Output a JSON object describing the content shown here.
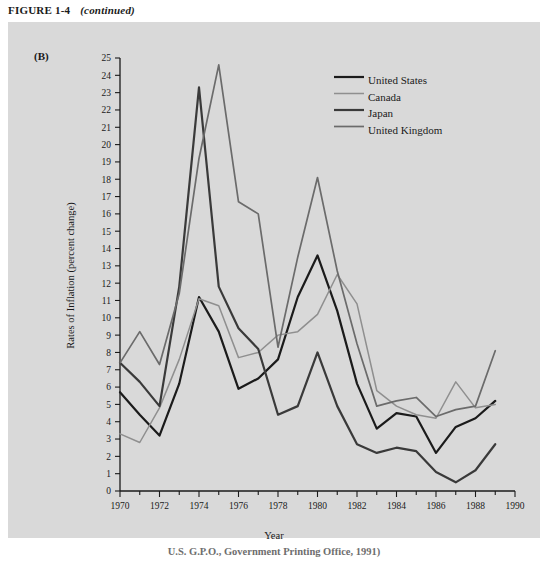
{
  "header": {
    "figure_number": "FIGURE 1-4",
    "continued": "(continued)"
  },
  "panel": {
    "label": "(B)"
  },
  "caption": {
    "text": "U.S. G.P.O., Government Printing Office, 1991)"
  },
  "axes": {
    "y_title": "Rates of Inflation (percent change)",
    "x_title": "Year",
    "y_ticks": [
      "0",
      "1",
      "2",
      "3",
      "4",
      "5",
      "6",
      "7",
      "8",
      "9",
      "10",
      "11",
      "12",
      "13",
      "14",
      "15",
      "16",
      "17",
      "18",
      "19",
      "20",
      "21",
      "22",
      "23",
      "24",
      "25"
    ],
    "x_ticks": [
      "1970",
      "1972",
      "1974",
      "1976",
      "1978",
      "1980",
      "1982",
      "1984",
      "1986",
      "1988",
      "1990"
    ]
  },
  "legend": {
    "position": "top-right",
    "entries": [
      {
        "label": "United States",
        "color": "#1b1b1b",
        "width": 2.2
      },
      {
        "label": "Canada",
        "color": "#8f8f8f",
        "width": 1.5
      },
      {
        "label": "Japan",
        "color": "#3a3a3a",
        "width": 2.2
      },
      {
        "label": "United Kingdom",
        "color": "#6b6b6b",
        "width": 1.7
      }
    ]
  },
  "chart_data": {
    "type": "line",
    "title": "Rates of Inflation (percent change)",
    "xlabel": "Year",
    "ylabel": "Rates of Inflation (percent change)",
    "xlim": [
      1970,
      1990
    ],
    "ylim": [
      0,
      25
    ],
    "grid": false,
    "legend_position": "top-right",
    "x": [
      1970,
      1971,
      1972,
      1973,
      1974,
      1975,
      1976,
      1977,
      1978,
      1979,
      1980,
      1981,
      1982,
      1983,
      1984,
      1985,
      1986,
      1987,
      1988,
      1989
    ],
    "series": [
      {
        "name": "United States",
        "color": "#1b1b1b",
        "values": [
          5.7,
          4.4,
          3.2,
          6.2,
          11.2,
          9.2,
          5.9,
          6.5,
          7.6,
          11.2,
          13.6,
          10.4,
          6.2,
          3.6,
          4.5,
          4.3,
          2.2,
          3.7,
          4.2,
          5.2
        ]
      },
      {
        "name": "Canada",
        "color": "#8f8f8f",
        "values": [
          3.3,
          2.8,
          4.8,
          7.6,
          11.1,
          10.7,
          7.7,
          8.0,
          9.0,
          9.2,
          10.2,
          12.5,
          10.8,
          5.8,
          4.9,
          4.4,
          4.2,
          6.3,
          4.8,
          5.0
        ]
      },
      {
        "name": "Japan",
        "color": "#3a3a3a",
        "values": [
          7.4,
          6.3,
          4.9,
          11.8,
          23.3,
          11.8,
          9.4,
          8.2,
          4.4,
          4.9,
          8.0,
          4.9,
          2.7,
          2.2,
          2.5,
          2.3,
          1.1,
          0.5,
          1.2,
          2.7
        ]
      },
      {
        "name": "United Kingdom",
        "color": "#6b6b6b",
        "values": [
          7.4,
          9.2,
          7.3,
          11.4,
          19.2,
          24.6,
          16.7,
          16.0,
          8.3,
          13.5,
          18.1,
          12.7,
          8.5,
          4.9,
          5.2,
          5.4,
          4.3,
          4.7,
          4.9,
          8.1
        ]
      }
    ]
  }
}
